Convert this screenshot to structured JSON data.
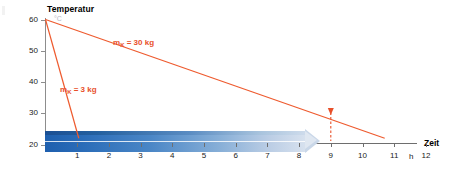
{
  "chart_data": {
    "type": "line",
    "title": "Temperatur",
    "xlabel": "Zeit",
    "ylabel": "Temperatur",
    "x_unit": "h",
    "y_unit": "°C",
    "xlim": [
      0,
      12.4
    ],
    "ylim": [
      18,
      62
    ],
    "grid": false,
    "legend_position": "inline-annotations",
    "x_ticks": [
      "1",
      "2",
      "3",
      "4",
      "5",
      "6",
      "7",
      "8",
      "9",
      "10",
      "11",
      "12"
    ],
    "x_tick_values": [
      1,
      2,
      3,
      4,
      5,
      6,
      7,
      8,
      9,
      10,
      11,
      12
    ],
    "y_ticks": [
      "60",
      "50",
      "40",
      "30",
      "20"
    ],
    "y_tick_values": [
      60,
      50,
      40,
      30,
      20
    ],
    "series": [
      {
        "name": "m_K = 3 kg",
        "label_text": "m",
        "label_sub": "K",
        "label_rest": " = 3 kg",
        "color": "#ee5a2e",
        "x": [
          0,
          1.05
        ],
        "y": [
          60,
          22
        ]
      },
      {
        "name": "m_K = 30 kg",
        "label_text": "m",
        "label_sub": "K",
        "label_rest": " = 30 kg",
        "color": "#ee5a2e",
        "x": [
          0,
          10.7
        ],
        "y": [
          60,
          22
        ]
      }
    ],
    "annotations": [
      {
        "name": "marker-arrow-9h",
        "type": "vertical-arrow-down",
        "x": 9,
        "color": "#e8502a",
        "note": ""
      },
      {
        "name": "process-bar",
        "type": "gradient-arrow-bar",
        "x_start": 0,
        "x_end": 9,
        "y": 22,
        "color_start": "#1e5fae",
        "color_end": "#d8e2ef"
      }
    ]
  },
  "axes": {
    "y_title": "Temperatur",
    "y_unit": "°C",
    "x_title": "Zeit",
    "x_unit": "h"
  },
  "colors": {
    "accent_red": "#ee5a2e",
    "axis_gray": "#6e6e6e",
    "bar_blue_dark": "#1e5fae",
    "bar_blue_light": "#d8e2ef"
  }
}
